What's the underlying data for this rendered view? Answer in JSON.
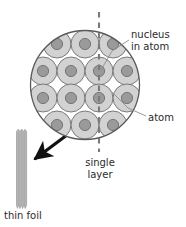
{
  "figure": {
    "labels": {
      "nucleus_line1": "nucleus",
      "nucleus_line2": "in atom",
      "atom": "atom",
      "single_layer_line1": "single",
      "single_layer_line2": "layer",
      "thin_foil": "thin foil"
    },
    "colors": {
      "atom_fill": "#d2d2d2",
      "atom_stroke": "#6e6e6e",
      "nucleus_fill": "#9a9a9a",
      "nucleus_stroke": "#6e6e6e",
      "circle_stroke": "#5a5a5a",
      "foil_fill": "#b4b4b4",
      "foil_stroke": "#8c8c8c",
      "dashed_line": "#7a7a7a",
      "leader_line": "#8c8c8c",
      "arrow": "#111111",
      "text": "#2b2b2b",
      "background": "#ffffff"
    },
    "magnified_circle": {
      "center_x": 85,
      "center_y": 85,
      "radius": 55
    },
    "atom_radius": 14,
    "nucleus_radius": 5.5,
    "atom_rows": [
      {
        "y": 44,
        "xs": [
          57,
          85,
          113
        ]
      },
      {
        "y": 71,
        "xs": [
          43,
          71,
          99,
          127
        ]
      },
      {
        "y": 98,
        "xs": [
          43,
          71,
          99,
          127
        ]
      },
      {
        "y": 125,
        "xs": [
          57,
          85,
          113
        ]
      }
    ],
    "dashed_line": {
      "x": 99,
      "y_top": 12,
      "y_bottom": 152
    },
    "foil": {
      "x": 16,
      "y": 129,
      "width": 11,
      "height": 79
    },
    "arrow": {
      "from_x": 72,
      "from_y": 131,
      "to_x": 33,
      "to_y": 160
    }
  }
}
